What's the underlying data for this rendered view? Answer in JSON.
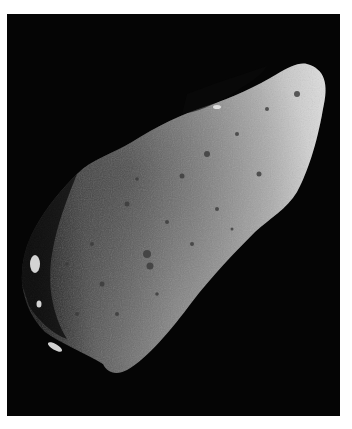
{
  "image": {
    "subject": "asteroid",
    "description": "Grayscale photograph of an elongated, heavily cratered asteroid against a black background, lit from the right",
    "colors": {
      "background": "#050505",
      "border": "#ffffff",
      "surface_light": "#d8d8d8",
      "surface_mid": "#8a8a8a",
      "surface_dark": "#2a2a2a"
    }
  }
}
